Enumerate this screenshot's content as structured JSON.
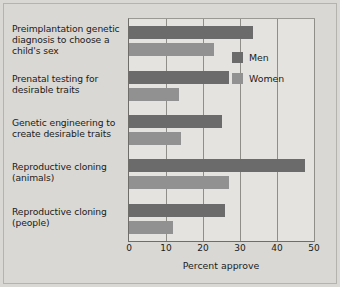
{
  "chart_data": {
    "type": "bar",
    "orientation": "horizontal",
    "title": "",
    "xlabel": "Percent approve",
    "ylabel": "",
    "xlim": [
      0,
      50
    ],
    "xticks": [
      0,
      10,
      20,
      30,
      40,
      50
    ],
    "xtick_labels": [
      "0",
      "10",
      "20",
      "30",
      "40",
      "50"
    ],
    "grid": true,
    "grid_axis": "x",
    "legend_position": "inside-upper-right",
    "categories": [
      "Preimplantation genetic diagnosis to choose a child's sex",
      "Prenatal testing for desirable traits",
      "Genetic engineering to create desirable traits",
      "Reproductive cloning (animals)",
      "Reproductive cloning (people)"
    ],
    "category_lines": [
      [
        "Preimplantation genetic",
        "diagnosis to choose a",
        "child's sex"
      ],
      [
        "Prenatal testing for",
        "desirable traits"
      ],
      [
        "Genetic engineering to",
        "create desirable traits"
      ],
      [
        "Reproductive cloning",
        "(animals)"
      ],
      [
        "Reproductive cloning",
        "(people)"
      ]
    ],
    "series": [
      {
        "name": "Men",
        "color": "#6b6b6b",
        "values": [
          33.5,
          27,
          25,
          47.5,
          26
        ]
      },
      {
        "name": "Women",
        "color": "#919191",
        "values": [
          23,
          13.5,
          14,
          27,
          12
        ]
      }
    ]
  },
  "colors": {
    "page_background": "#d9d8d4",
    "plot_background": "#e4e3df",
    "axis": "#6e6d69",
    "gridline": "#8f8e89",
    "men": "#6b6b6b",
    "women": "#919191",
    "text": "#1b1b1b"
  }
}
